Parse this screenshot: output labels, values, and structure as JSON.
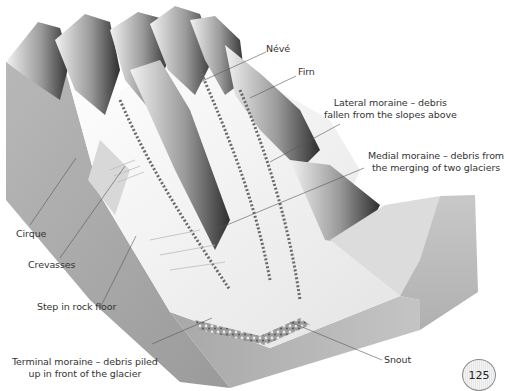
{
  "diagram": {
    "labels": {
      "neve": "Névé",
      "firn": "Firn",
      "lateral_moraine": [
        "Lateral moraine – debris",
        "fallen from the slopes above"
      ],
      "medial_moraine": [
        "Medial moraine – debris from",
        "the merging of two glaciers"
      ],
      "cirque": "Cirque",
      "crevasses": "Crevasses",
      "step": "Step in rock floor",
      "terminal_moraine": [
        "Terminal moraine – debris piled",
        "up in front of the glacier"
      ],
      "snout": "Snout"
    }
  },
  "page_number": "125",
  "colors": {
    "label_text": "#333333",
    "leader_line": "#555555",
    "rock_side": "#a9a9a9",
    "ice": "#f4f4f4",
    "mountain_dark": "#3a3a3a"
  }
}
